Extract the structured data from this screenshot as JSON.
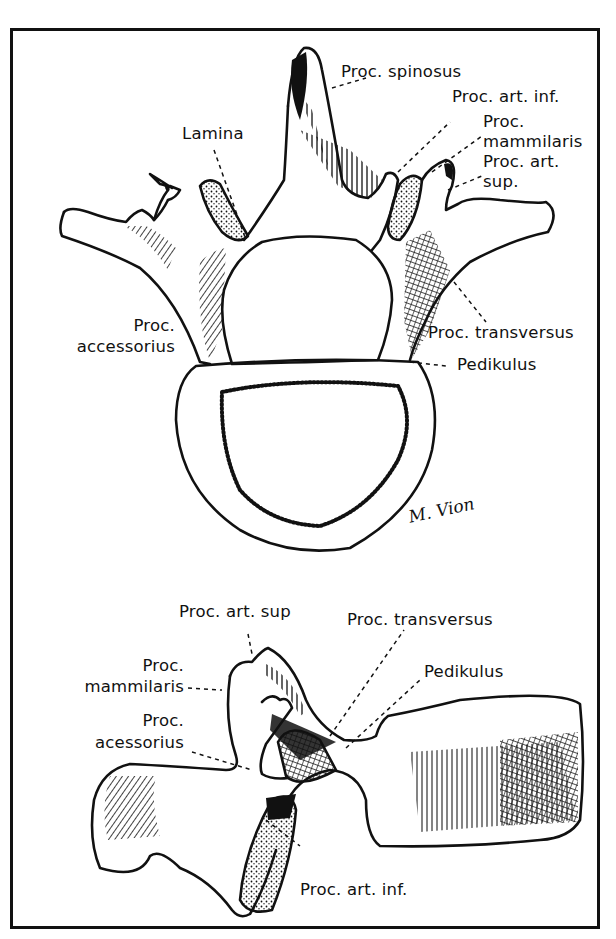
{
  "figure": {
    "top_view": {
      "title": "Lumbar vertebra, superior view",
      "labels": [
        {
          "id": "proc-spinosus",
          "text": "Proc. spinosus"
        },
        {
          "id": "proc-art-inf",
          "text": "Proc. art. inf."
        },
        {
          "id": "proc-mammilaris-1",
          "text": "Proc."
        },
        {
          "id": "proc-mammilaris-2",
          "text": "mammilaris"
        },
        {
          "id": "proc-art-sup-1",
          "text": "Proc. art."
        },
        {
          "id": "proc-art-sup-2",
          "text": "sup."
        },
        {
          "id": "lamina",
          "text": "Lamina"
        },
        {
          "id": "proc-accessorius-1",
          "text": "Proc."
        },
        {
          "id": "proc-accessorius-2",
          "text": "accessorius"
        },
        {
          "id": "proc-transversus",
          "text": "Proc. transversus"
        },
        {
          "id": "pedikulus",
          "text": "Pedikulus"
        }
      ],
      "signature": "M. Vion"
    },
    "side_view": {
      "title": "Lumbar vertebra, lateral view",
      "labels": [
        {
          "id": "proc-art-sup",
          "text": "Proc. art. sup"
        },
        {
          "id": "proc-transversus",
          "text": "Proc. transversus"
        },
        {
          "id": "proc-mammilaris-1",
          "text": "Proc."
        },
        {
          "id": "proc-mammilaris-2",
          "text": "mammilaris"
        },
        {
          "id": "pedikulus",
          "text": "Pedikulus"
        },
        {
          "id": "proc-acessorius-1",
          "text": "Proc."
        },
        {
          "id": "proc-acessorius-2",
          "text": "acessorius"
        },
        {
          "id": "proc-art-inf",
          "text": "Proc. art. inf."
        }
      ]
    }
  }
}
